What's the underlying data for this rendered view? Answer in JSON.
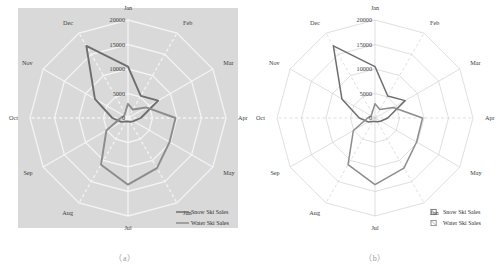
{
  "figure": {
    "panels": [
      {
        "id": "a",
        "caption": "（a）",
        "style": "shaded-gray-plot-area"
      },
      {
        "id": "b",
        "caption": "（b）",
        "style": "white-plot-area"
      }
    ]
  },
  "chart_data": {
    "type": "line",
    "variant": "radar",
    "title": "",
    "xlabel": "",
    "ylabel": "",
    "categories": [
      "Jan",
      "Feb",
      "Mar",
      "Apr",
      "May",
      "Jun",
      "Jul",
      "Aug",
      "Sep",
      "Oct",
      "Nov",
      "Dec"
    ],
    "tick_labels": [
      "0",
      "5000",
      "10000",
      "15000",
      "20000"
    ],
    "ticks": [
      0,
      5000,
      10000,
      15000,
      20000
    ],
    "ylim": [
      0,
      20000
    ],
    "grid": true,
    "legend_position": "bottom-right",
    "series": [
      {
        "name": "Snow Ski Sales",
        "color": "#6e6e6e",
        "values": [
          10500,
          5200,
          7100,
          2600,
          1300,
          900,
          700,
          800,
          1600,
          3200,
          7800,
          17000
        ]
      },
      {
        "name": "Water Ski Sales",
        "color": "#8c8c8c",
        "values": [
          2900,
          2000,
          4300,
          9700,
          9800,
          11800,
          13600,
          11000,
          5100,
          1500,
          900,
          1200
        ]
      }
    ]
  },
  "legend": {
    "panel_a": {
      "items": [
        {
          "label": "Snow Ski Sales",
          "marker": "line-swatch",
          "color": "#6e6e6e"
        },
        {
          "label": "Water Ski Sales",
          "marker": "line-swatch",
          "color": "#8c8c8c"
        }
      ]
    },
    "panel_b": {
      "items": [
        {
          "label": "Snow Ski Sales",
          "marker": "square-swatch",
          "color": "#6e6e6e"
        },
        {
          "label": "Water Ski Sales",
          "marker": "square-swatch",
          "color": "#8c8c8c"
        }
      ]
    }
  },
  "colors": {
    "plot_background_a": "#d9d9d9",
    "plot_background_b": "#ffffff",
    "grid_a": "#f2f2f2",
    "grid_b": "#c9c9c9",
    "series_snow": "#6e6e6e",
    "series_water": "#8c8c8c",
    "text": "#3a3a3a",
    "caption": "#9a9a9a"
  }
}
